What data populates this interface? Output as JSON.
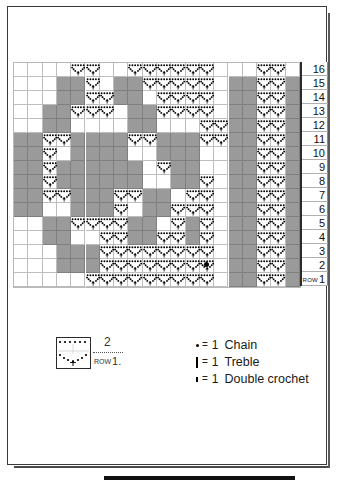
{
  "chart_data": {
    "type": "heatmap",
    "xlabel": "",
    "ylabel": "Row",
    "columns": 20,
    "rows": 16,
    "grid_note": "1 = shaded (treble/background) square, 0 = open (chain arc) square; rows listed top (16) to bottom (1)",
    "row_labels": [
      "16",
      "15",
      "14",
      "13",
      "12",
      "11",
      "10",
      "9",
      "8",
      "7",
      "6",
      "5",
      "4",
      "3",
      "2",
      "1"
    ],
    "row1_prefix": "ROW",
    "cells": [
      [
        0,
        0,
        0,
        0,
        0,
        0,
        0,
        0,
        0,
        0,
        0,
        0,
        0,
        0,
        0,
        0,
        0,
        0,
        0,
        0
      ],
      [
        0,
        0,
        0,
        1,
        1,
        0,
        0,
        1,
        1,
        0,
        0,
        0,
        0,
        0,
        0,
        1,
        1,
        0,
        0,
        1
      ],
      [
        0,
        0,
        0,
        1,
        1,
        0,
        0,
        1,
        1,
        0,
        0,
        0,
        0,
        0,
        0,
        1,
        1,
        0,
        0,
        1
      ],
      [
        0,
        0,
        1,
        1,
        0,
        0,
        0,
        0,
        1,
        1,
        0,
        0,
        0,
        0,
        0,
        1,
        1,
        0,
        0,
        1
      ],
      [
        0,
        0,
        1,
        1,
        0,
        0,
        0,
        0,
        1,
        1,
        0,
        0,
        0,
        0,
        0,
        1,
        1,
        0,
        0,
        1
      ],
      [
        1,
        1,
        0,
        0,
        1,
        1,
        1,
        1,
        0,
        0,
        1,
        1,
        1,
        0,
        0,
        1,
        1,
        0,
        0,
        1
      ],
      [
        1,
        1,
        0,
        0,
        1,
        1,
        1,
        1,
        0,
        0,
        1,
        1,
        1,
        0,
        0,
        1,
        1,
        0,
        0,
        1
      ],
      [
        1,
        1,
        0,
        1,
        1,
        1,
        1,
        1,
        1,
        0,
        0,
        1,
        1,
        0,
        0,
        1,
        1,
        0,
        0,
        1
      ],
      [
        1,
        1,
        0,
        1,
        1,
        1,
        1,
        1,
        1,
        0,
        0,
        1,
        1,
        0,
        0,
        1,
        1,
        0,
        0,
        1
      ],
      [
        1,
        1,
        0,
        0,
        1,
        1,
        1,
        0,
        0,
        1,
        1,
        0,
        0,
        0,
        0,
        1,
        1,
        0,
        0,
        1
      ],
      [
        1,
        1,
        0,
        0,
        1,
        1,
        1,
        0,
        0,
        1,
        1,
        0,
        0,
        0,
        0,
        1,
        1,
        0,
        0,
        1
      ],
      [
        0,
        0,
        1,
        1,
        0,
        0,
        0,
        0,
        1,
        1,
        0,
        0,
        1,
        0,
        0,
        1,
        1,
        0,
        0,
        1
      ],
      [
        0,
        0,
        1,
        1,
        0,
        0,
        0,
        0,
        1,
        1,
        0,
        0,
        1,
        0,
        0,
        1,
        1,
        0,
        0,
        1
      ],
      [
        0,
        0,
        0,
        1,
        1,
        1,
        0,
        0,
        0,
        0,
        0,
        0,
        0,
        0,
        0,
        1,
        1,
        0,
        0,
        1
      ],
      [
        0,
        0,
        0,
        1,
        1,
        1,
        0,
        0,
        0,
        0,
        0,
        0,
        0,
        0,
        0,
        1,
        1,
        0,
        0,
        1
      ],
      [
        0,
        0,
        0,
        0,
        0,
        0,
        0,
        0,
        0,
        0,
        0,
        0,
        0,
        0,
        0,
        1,
        1,
        0,
        0,
        1
      ]
    ],
    "arc_cells": [
      {
        "row": 16,
        "cols": [
          5,
          6,
          9,
          10,
          11,
          12,
          13,
          14,
          18,
          19
        ]
      },
      {
        "row": 15,
        "cols": [
          5,
          6,
          9,
          10,
          11,
          12,
          13,
          14,
          18,
          19
        ]
      },
      {
        "row": 14,
        "cols": [
          4,
          5,
          6,
          7,
          11,
          12,
          13,
          14,
          18,
          19
        ]
      },
      {
        "row": 13,
        "cols": [
          4,
          5,
          6,
          7,
          11,
          12,
          13,
          14,
          18,
          19
        ]
      },
      {
        "row": 12,
        "cols": [
          3,
          4,
          9,
          10,
          14,
          15,
          18,
          19
        ]
      },
      {
        "row": 11,
        "cols": [
          3,
          4,
          9,
          10,
          14,
          15,
          18,
          19
        ]
      },
      {
        "row": 10,
        "cols": [
          3,
          11,
          12,
          18,
          19
        ]
      },
      {
        "row": 9,
        "cols": [
          3,
          11,
          12,
          18,
          19
        ]
      },
      {
        "row": 8,
        "cols": [
          3,
          4,
          8,
          9,
          13,
          14,
          18,
          19
        ]
      },
      {
        "row": 7,
        "cols": [
          3,
          4,
          8,
          9,
          13,
          14,
          18,
          19
        ]
      },
      {
        "row": 6,
        "cols": [
          5,
          6,
          7,
          8,
          12,
          13,
          14,
          18,
          19
        ]
      },
      {
        "row": 5,
        "cols": [
          5,
          6,
          7,
          8,
          12,
          13,
          14,
          18,
          19
        ]
      },
      {
        "row": 4,
        "cols": [
          7,
          8,
          9,
          10,
          11,
          12,
          13,
          14,
          18,
          19
        ]
      },
      {
        "row": 3,
        "cols": [
          7,
          8,
          9,
          10,
          11,
          12,
          13,
          14,
          18,
          19
        ]
      },
      {
        "row": 2,
        "cols": [
          6,
          7,
          8,
          9,
          10,
          11,
          12,
          13,
          14,
          18,
          19
        ]
      },
      {
        "row": 1,
        "cols": [
          6,
          7,
          8,
          9,
          10,
          11,
          12,
          13,
          14,
          18,
          19
        ]
      }
    ]
  },
  "legend": {
    "repeat": {
      "count": "2",
      "row_word": "ROW",
      "row_number": "1."
    },
    "key": [
      {
        "symbol": "chain-dot",
        "equals": "=",
        "count": "1",
        "label": "Chain"
      },
      {
        "symbol": "treble-bar",
        "equals": "=",
        "count": "1",
        "label": "Treble"
      },
      {
        "symbol": "double-crochet-bar",
        "equals": "=",
        "count": "1",
        "label": "Double crochet"
      }
    ]
  },
  "colors": {
    "filled_cell": "#9a9a9a",
    "empty_cell": "#ffffff",
    "grid_line": "#bdbdbd",
    "ink": "#111111"
  }
}
